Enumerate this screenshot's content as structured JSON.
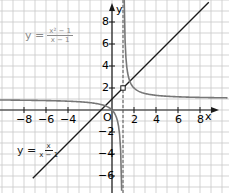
{
  "chart_data": {
    "type": "line",
    "title": "",
    "xlabel": "x",
    "ylabel": "y",
    "origin_label": "O",
    "xlim": [
      -10,
      10
    ],
    "ylim": [
      -7,
      9
    ],
    "xticks": [
      -8,
      -6,
      -4,
      2,
      4,
      6,
      8
    ],
    "yticks": [
      -6,
      -4,
      -2,
      2,
      4,
      6,
      8
    ],
    "grid": true,
    "asymptotes": [
      {
        "type": "vertical",
        "x": 1,
        "style": "dashed"
      }
    ],
    "series": [
      {
        "name": "y = (x² − 1)/(x − 1)",
        "formula": "x+1",
        "color": "#1a1a1a",
        "hole": [
          1,
          2
        ]
      },
      {
        "name": "y = x/(x − 1)",
        "formula": "x/(x-1)",
        "color": "#777777"
      }
    ],
    "annotations": [
      {
        "text": "y = (x² − 1)/(x − 1)",
        "num": "x² − 1",
        "den": "x − 1",
        "color": "#8a8a8a",
        "position": "upper-left"
      },
      {
        "text": "y = x/(x − 1)",
        "num": "x",
        "den": "x − 1",
        "color": "#1a1a1a",
        "position": "lower-left"
      }
    ]
  },
  "labels": {
    "x_axis": "x",
    "y_axis": "y",
    "origin": "O",
    "eq1_prefix": "y =",
    "eq1_num": "x² − 1",
    "eq1_den": "x − 1",
    "eq2_prefix": "y =",
    "eq2_num": "x",
    "eq2_den": "x − 1"
  },
  "ticks": {
    "x": [
      {
        "v": -8,
        "t": "−8"
      },
      {
        "v": -6,
        "t": "−6"
      },
      {
        "v": -4,
        "t": "−4"
      },
      {
        "v": 2,
        "t": "2"
      },
      {
        "v": 4,
        "t": "4"
      },
      {
        "v": 6,
        "t": "6"
      },
      {
        "v": 8,
        "t": "8"
      }
    ],
    "y": [
      {
        "v": 8,
        "t": "8"
      },
      {
        "v": 6,
        "t": "6"
      },
      {
        "v": 4,
        "t": "4"
      },
      {
        "v": 2,
        "t": "2"
      },
      {
        "v": -2,
        "t": "−2"
      },
      {
        "v": -4,
        "t": "−4"
      },
      {
        "v": -6,
        "t": "−6"
      }
    ]
  }
}
